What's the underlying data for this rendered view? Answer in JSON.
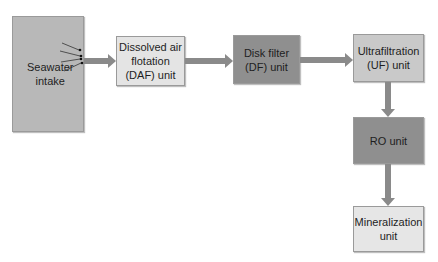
{
  "diagram": {
    "type": "process-flow",
    "nodes": [
      {
        "id": "intake",
        "label": "Seawater intake",
        "lines": [
          "Seawater",
          "intake"
        ],
        "fill": "#b8b8b8"
      },
      {
        "id": "daf",
        "label": "Dissolved air flotation (DAF) unit",
        "lines": [
          "Dissolved air",
          "flotation",
          "(DAF) unit"
        ],
        "fill": "#e4e4e4"
      },
      {
        "id": "df",
        "label": "Disk filter (DF) unit",
        "lines": [
          "Disk filter",
          "(DF) unit"
        ],
        "fill": "#8f8f8f"
      },
      {
        "id": "uf",
        "label": "Ultrafiltration (UF) unit",
        "lines": [
          "Ultrafiltration",
          "(UF) unit"
        ],
        "fill": "#c9c9c9"
      },
      {
        "id": "ro",
        "label": "RO unit",
        "lines": [
          "RO unit"
        ],
        "fill": "#8f8f8f"
      },
      {
        "id": "min",
        "label": "Mineralization unit",
        "lines": [
          "Mineralization",
          "unit"
        ],
        "fill": "#e6e6e6"
      }
    ],
    "edges": [
      {
        "from": "intake",
        "to": "daf"
      },
      {
        "from": "daf",
        "to": "df"
      },
      {
        "from": "df",
        "to": "uf"
      },
      {
        "from": "uf",
        "to": "ro"
      },
      {
        "from": "ro",
        "to": "min"
      }
    ],
    "arrow_color": "#8a8a8a"
  }
}
